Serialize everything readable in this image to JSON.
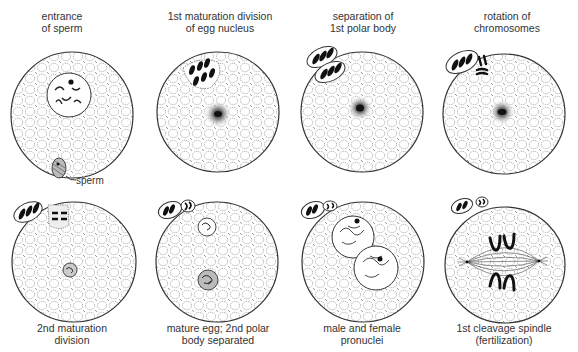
{
  "figure": {
    "stages": [
      {
        "id": "entrance-of-sperm",
        "line1": "entrance",
        "line2": "of sperm"
      },
      {
        "id": "first-maturation-division",
        "line1": "1st maturation division",
        "line2": "of egg nucleus"
      },
      {
        "id": "separation-first-polar-body",
        "line1": "separation of",
        "line2": "1st polar body"
      },
      {
        "id": "rotation-of-chromosomes",
        "line1": "rotation of",
        "line2": "chromosomes"
      },
      {
        "id": "second-maturation-division",
        "line1": "2nd maturation",
        "line2": "division"
      },
      {
        "id": "mature-egg",
        "line1": "mature egg; 2nd polar",
        "line2": "body separated"
      },
      {
        "id": "male-female-pronuclei",
        "line1": "male and female",
        "line2": "pronuclei"
      },
      {
        "id": "first-cleavage-spindle",
        "line1": "1st cleavage spindle",
        "line2": "(fertilization)"
      }
    ],
    "annotations": {
      "sperm": "sperm"
    },
    "colors": {
      "ink": "#2a2a2a",
      "stipple": "#777777",
      "background": "#ffffff"
    }
  }
}
